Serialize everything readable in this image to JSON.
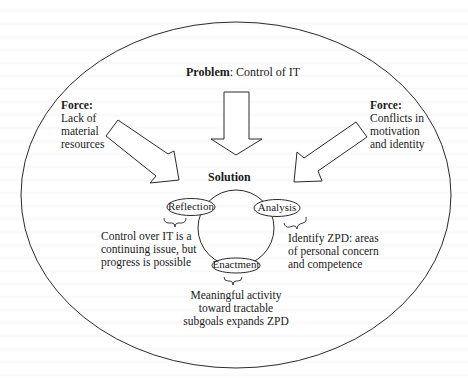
{
  "problem": {
    "label": "Problem",
    "text": ": Control of IT"
  },
  "forces": {
    "left": {
      "label": "Force:",
      "lines": [
        "Lack of",
        "material",
        "resources"
      ]
    },
    "right": {
      "label": "Force:",
      "lines": [
        "Conflicts in",
        "motivation",
        "and identity"
      ]
    }
  },
  "solution": {
    "label": "Solution",
    "cycle": [
      {
        "name": "Reflection",
        "note_lines": [
          "Control over IT is a",
          "continuing issue, but",
          "progress is possible"
        ]
      },
      {
        "name": "Analysis",
        "note_lines": [
          "Identify ZPD: areas",
          "of personal concern",
          "and competence"
        ]
      },
      {
        "name": "Enactment",
        "note_lines": [
          "Meaningful activity",
          "toward tractable",
          "subgoals expands ZPD"
        ]
      }
    ]
  },
  "colors": {
    "stroke": "#2a2a2a",
    "text": "#1a1a1a",
    "background": "#ffffff"
  }
}
